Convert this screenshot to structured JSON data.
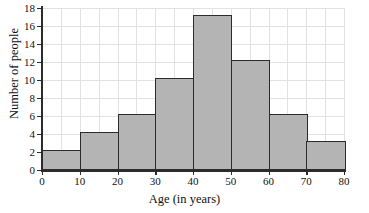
{
  "chart_data": {
    "type": "bar",
    "title": "",
    "xlabel": "Age (in years)",
    "ylabel": "Number of people",
    "categories": [
      "0-10",
      "10-20",
      "20-30",
      "30-40",
      "40-50",
      "50-60",
      "60-70",
      "70-80"
    ],
    "bin_edges": [
      0,
      10,
      20,
      30,
      40,
      50,
      60,
      70,
      80
    ],
    "values": [
      2,
      4,
      6,
      10,
      17,
      12,
      6,
      3
    ],
    "xlim": [
      0,
      80
    ],
    "ylim": [
      0,
      18
    ],
    "x_ticks": [
      0,
      10,
      20,
      30,
      40,
      50,
      60,
      70,
      80
    ],
    "y_ticks": [
      0,
      2,
      4,
      6,
      8,
      10,
      12,
      14,
      16,
      18
    ],
    "x_tick_labels": [
      "0",
      "10",
      "20",
      "30",
      "40",
      "50",
      "60",
      "70",
      "80"
    ],
    "y_tick_labels": [
      "0",
      "2",
      "4",
      "6",
      "8",
      "10",
      "12",
      "14",
      "16",
      "18"
    ],
    "grid": true,
    "grid_minor_x_step": 5,
    "grid_y_step": 2,
    "legend": null,
    "bar_fill_color": "#b4b4b4",
    "bar_edge_color": "#2b2b2b",
    "grid_color": "#e2e2e2",
    "axis_color": "#2b2b2b"
  }
}
